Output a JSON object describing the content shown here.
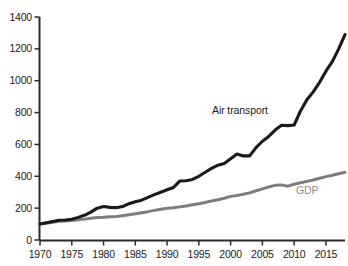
{
  "chart_data": {
    "type": "line",
    "title": "",
    "subtitle": "",
    "xlabel": "",
    "ylabel": "",
    "xlim": [
      1970,
      2018
    ],
    "ylim": [
      0,
      1400
    ],
    "grid": false,
    "legend_position": "inline-annotation",
    "index_note": "Index, 1970 = 100",
    "x_ticks": [
      1970,
      1975,
      1980,
      1985,
      1990,
      1995,
      2000,
      2005,
      2010,
      2015
    ],
    "y_ticks": [
      0,
      200,
      400,
      600,
      800,
      1000,
      1200,
      1400
    ],
    "x": [
      1970,
      1971,
      1972,
      1973,
      1974,
      1975,
      1976,
      1977,
      1978,
      1979,
      1980,
      1981,
      1982,
      1983,
      1984,
      1985,
      1986,
      1987,
      1988,
      1989,
      1990,
      1991,
      1992,
      1993,
      1994,
      1995,
      1996,
      1997,
      1998,
      1999,
      2000,
      2001,
      2002,
      2003,
      2004,
      2005,
      2006,
      2007,
      2008,
      2009,
      2010,
      2011,
      2012,
      2013,
      2014,
      2015,
      2016,
      2017,
      2018
    ],
    "series": [
      {
        "name": "Air transport",
        "color": "#1a1a1a",
        "width": 3.1,
        "values": [
          100,
          108,
          116,
          124,
          126,
          130,
          142,
          155,
          175,
          200,
          210,
          205,
          203,
          210,
          228,
          240,
          250,
          268,
          285,
          300,
          315,
          330,
          370,
          372,
          380,
          400,
          425,
          450,
          470,
          480,
          510,
          540,
          528,
          528,
          580,
          620,
          650,
          690,
          720,
          718,
          722,
          810,
          880,
          930,
          990,
          1060,
          1120,
          1200,
          1290
        ]
      },
      {
        "name": "GDP",
        "color": "#7d7d7d",
        "width": 3.0,
        "values": [
          100,
          105,
          111,
          117,
          120,
          122,
          127,
          131,
          136,
          141,
          143,
          146,
          148,
          152,
          159,
          165,
          171,
          178,
          186,
          193,
          199,
          203,
          208,
          213,
          221,
          228,
          236,
          245,
          253,
          262,
          274,
          280,
          287,
          296,
          309,
          321,
          333,
          343,
          346,
          338,
          350,
          359,
          368,
          377,
          388,
          398,
          406,
          416,
          425
        ]
      }
    ],
    "annotations": [
      {
        "text": "Air transport",
        "series": "Air transport",
        "x_px": 212,
        "y_px": 104
      },
      {
        "text": "GDP",
        "series": "GDP",
        "x_px": 296,
        "y_px": 184
      }
    ]
  },
  "axes": {
    "y_tick_labels": [
      "1400",
      "1200",
      "1000",
      "800",
      "600",
      "400",
      "200",
      "0"
    ],
    "x_tick_labels": [
      "1970",
      "1975",
      "1980",
      "1985",
      "1990",
      "1995",
      "2000",
      "2005",
      "2010",
      "2015"
    ]
  },
  "colors": {
    "air_transport": "#1a1a1a",
    "gdp": "#7d7d7d",
    "axis": "#2b2b2b",
    "background": "#ffffff",
    "tick_text": "#1a1a1a"
  }
}
